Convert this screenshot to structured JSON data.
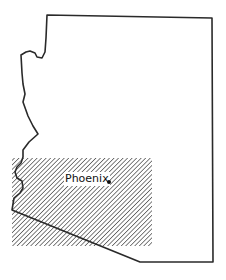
{
  "map": {
    "region": "Arizona",
    "outline_color": "#2a2a2a",
    "hatch_color": "#555555",
    "background": "#ffffff",
    "highlighted_area": {
      "style": "diagonal-hatch"
    },
    "cities": [
      {
        "name": "Phoenix",
        "marker": "dot"
      }
    ]
  }
}
